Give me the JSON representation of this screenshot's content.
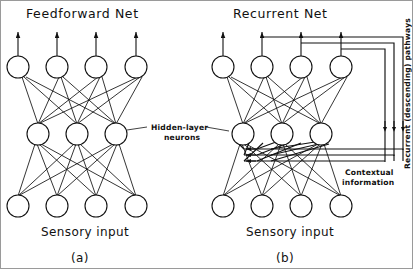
{
  "figure": {
    "panels": [
      {
        "id": "a",
        "title": "Feedforward  Net",
        "caption": "(a)",
        "input_label": "Sensory  input",
        "layers": [
          {
            "name": "output",
            "count": 4,
            "y": 66,
            "xs": [
              17,
              56,
              95,
              135
            ]
          },
          {
            "name": "hidden",
            "count": 3,
            "y": 133,
            "xs": [
              37,
              76,
              115
            ]
          },
          {
            "name": "input",
            "count": 4,
            "y": 205,
            "xs": [
              17,
              56,
              95,
              135
            ]
          }
        ],
        "output_arrows": 4
      },
      {
        "id": "b",
        "title": "Recurrent  Net",
        "caption": "(b)",
        "input_label": "Sensory  input",
        "layers": [
          {
            "name": "output",
            "count": 4,
            "y": 66,
            "xs": [
              222,
              261,
              300,
              340
            ]
          },
          {
            "name": "hidden",
            "count": 3,
            "y": 133,
            "xs": [
              242,
              281,
              320
            ]
          },
          {
            "name": "input",
            "count": 4,
            "y": 205,
            "xs": [
              222,
              261,
              300,
              340
            ]
          }
        ],
        "output_arrows": 4,
        "recurrent_count": 3
      }
    ],
    "annotations": {
      "hidden_layer": {
        "line1": "Hidden-layer",
        "line2": "neurons"
      },
      "contextual": {
        "line1": "Contextual",
        "line2": "information"
      },
      "recurrent_pathways": "Recurrent  (descending)  pathways"
    },
    "colors": {
      "ink": "#111111",
      "paper": "#ffffff",
      "border": "#9a9a9a"
    }
  }
}
